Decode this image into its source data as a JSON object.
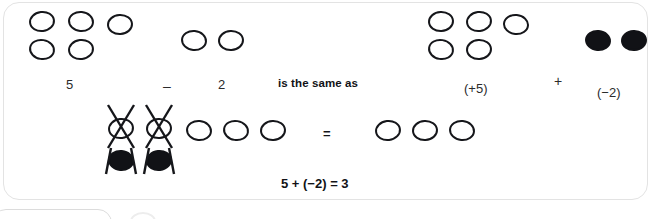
{
  "diagram": {
    "title_phrase": "is the same as",
    "result_equation": "5 + (−2) = 3",
    "equals_symbol": "=",
    "colors": {
      "positive_counter": "#ffffff",
      "positive_outline": "#15161a",
      "negative_counter": "#111216",
      "card_border": "#e3e3e3",
      "text": "#2b2b2b"
    },
    "rows": [
      {
        "name": "subtraction-statement",
        "groups": [
          {
            "label": "5",
            "counter_type": "positive",
            "count": 5,
            "layout": "3-over-2"
          },
          {
            "label": "2",
            "counter_type": "positive",
            "count": 2,
            "layout": "1-over-0"
          }
        ],
        "operator": "–"
      },
      {
        "name": "addition-statement",
        "groups": [
          {
            "label": "(+5)",
            "counter_type": "positive",
            "count": 5,
            "layout": "3-over-2"
          },
          {
            "label": "(−2)",
            "counter_type": "negative",
            "count": 2,
            "layout": "1-over-0"
          }
        ],
        "operator": "+"
      },
      {
        "name": "zero-pair-cancellation",
        "left_side": {
          "zero_pairs": 2,
          "remaining_positive": 3,
          "cancelled_note": "crossed-out zero pairs"
        },
        "right_side": {
          "positive": 3
        }
      }
    ]
  }
}
